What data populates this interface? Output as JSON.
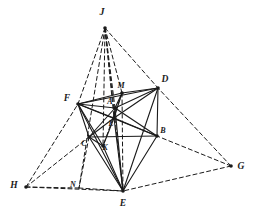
{
  "figure": {
    "kind": "line-drawing",
    "background_color": "#ffffff",
    "ink_color": "#1a1a1a",
    "solid_stroke_width": 1.1,
    "dashed_stroke_width": 1.0,
    "dash_pattern": "4,3",
    "node_radius": 1.8
  },
  "chart_data": {
    "type": "diagram",
    "xlabel": "",
    "ylabel": "",
    "points": [
      {
        "id": "J",
        "label": "J",
        "x": 105,
        "y": 28,
        "label_x": 102,
        "label_y": 13,
        "node": true,
        "font_size": 10
      },
      {
        "id": "D",
        "label": "D",
        "x": 158,
        "y": 88,
        "label_x": 165,
        "label_y": 80,
        "node": true,
        "font_size": 9.5
      },
      {
        "id": "F",
        "label": "F",
        "x": 78,
        "y": 104,
        "label_x": 67,
        "label_y": 99,
        "node": true,
        "font_size": 9.5
      },
      {
        "id": "M",
        "label": "M",
        "x": 122,
        "y": 93,
        "label_x": 121,
        "label_y": 86,
        "node": true,
        "font_size": 8
      },
      {
        "id": "A",
        "label": "A",
        "x": 115,
        "y": 108,
        "label_x": 110,
        "label_y": 102,
        "node": true,
        "font_size": 8
      },
      {
        "id": "L",
        "label": "L",
        "x": 114,
        "y": 118,
        "label_x": 111,
        "label_y": 124,
        "node": true,
        "font_size": 8
      },
      {
        "id": "B",
        "label": "B",
        "x": 157,
        "y": 136,
        "label_x": 163,
        "label_y": 131,
        "node": true,
        "font_size": 8
      },
      {
        "id": "C",
        "label": "C",
        "x": 89,
        "y": 137,
        "label_x": 84,
        "label_y": 144,
        "node": true,
        "font_size": 8
      },
      {
        "id": "K",
        "label": "K",
        "x": 103,
        "y": 146,
        "label_x": 105,
        "label_y": 148,
        "node": true,
        "font_size": 8
      },
      {
        "id": "E",
        "label": "E",
        "x": 123,
        "y": 191,
        "label_x": 123,
        "label_y": 204,
        "node": true,
        "font_size": 9.5
      },
      {
        "id": "G",
        "label": "G",
        "x": 231,
        "y": 166,
        "label_x": 241,
        "label_y": 167,
        "node": true,
        "font_size": 9.5
      },
      {
        "id": "H",
        "label": "H",
        "x": 26,
        "y": 187,
        "label_x": 14,
        "label_y": 186,
        "node": true,
        "font_size": 9.5
      },
      {
        "id": "N",
        "label": "N",
        "x": 79,
        "y": 188,
        "label_x": 73,
        "label_y": 185,
        "node": false,
        "font_size": 8
      }
    ],
    "solid_edges": [
      [
        "F",
        "D"
      ],
      [
        "F",
        "M"
      ],
      [
        "F",
        "A"
      ],
      [
        "F",
        "L"
      ],
      [
        "F",
        "B"
      ],
      [
        "F",
        "C"
      ],
      [
        "F",
        "K"
      ],
      [
        "F",
        "E"
      ],
      [
        "M",
        "D"
      ],
      [
        "M",
        "A"
      ],
      [
        "M",
        "L"
      ],
      [
        "A",
        "D"
      ],
      [
        "A",
        "B"
      ],
      [
        "A",
        "L"
      ],
      [
        "A",
        "C"
      ],
      [
        "A",
        "E"
      ],
      [
        "L",
        "D"
      ],
      [
        "L",
        "B"
      ],
      [
        "L",
        "C"
      ],
      [
        "L",
        "E"
      ],
      [
        "L",
        "K"
      ],
      [
        "D",
        "B"
      ],
      [
        "D",
        "E"
      ],
      [
        "C",
        "B"
      ],
      [
        "C",
        "E"
      ],
      [
        "C",
        "K"
      ],
      [
        "K",
        "E"
      ],
      [
        "B",
        "E"
      ]
    ],
    "dashed_edges": [
      [
        "J",
        "F"
      ],
      [
        "J",
        "D"
      ],
      [
        "J",
        "M"
      ],
      [
        "J",
        "A"
      ],
      [
        "J",
        "L"
      ],
      [
        "J",
        "K"
      ],
      [
        "J",
        "E"
      ],
      [
        "J",
        "N"
      ],
      [
        "H",
        "F"
      ],
      [
        "H",
        "C"
      ],
      [
        "H",
        "N"
      ],
      [
        "H",
        "E"
      ],
      [
        "G",
        "D"
      ],
      [
        "G",
        "B"
      ],
      [
        "G",
        "E"
      ],
      [
        "D",
        "G"
      ],
      [
        "F",
        "H"
      ],
      [
        "N",
        "E"
      ],
      [
        "E",
        "G"
      ],
      [
        "C",
        "N"
      ],
      [
        "M",
        "K"
      ],
      [
        "M",
        "E"
      ]
    ]
  }
}
